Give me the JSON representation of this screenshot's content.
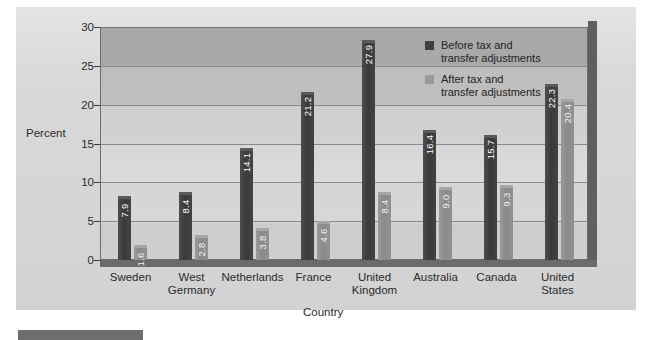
{
  "chart_data": {
    "type": "bar",
    "title": "",
    "xlabel": "Country",
    "ylabel": "Percent",
    "ylim": [
      0,
      30
    ],
    "yticks": [
      "0",
      "5",
      "10",
      "15",
      "20",
      "25",
      "30"
    ],
    "grid": true,
    "legend_position": "inside-top-right",
    "categories": [
      "Sweden",
      "West\nGermany",
      "Netherlands",
      "France",
      "United\nKingdom",
      "Australia",
      "Canada",
      "United\nStates"
    ],
    "series": [
      {
        "name": "Before tax and\ntransfer adjustments",
        "color": "#3f3f3f",
        "values": [
          7.9,
          8.4,
          14.1,
          21.2,
          27.9,
          16.4,
          15.7,
          22.3
        ],
        "labels": [
          "7.9",
          "8.4",
          "14.1",
          "21.2",
          "27.9",
          "16.4",
          "15.7",
          "22.3"
        ]
      },
      {
        "name": "After tax and\ntransfer adjustments",
        "color": "#9a9a9a",
        "values": [
          1.6,
          2.8,
          3.8,
          4.6,
          8.4,
          9.0,
          9.3,
          20.4
        ],
        "labels": [
          "1.6",
          "2.8",
          "3.8",
          "4.6",
          "8.4",
          "9.0",
          "9.3",
          "20.4"
        ]
      }
    ]
  },
  "legend": {
    "items": [
      {
        "label": "Before tax and\ntransfer adjustments",
        "color": "#3f3f3f"
      },
      {
        "label": "After tax and\ntransfer adjustments",
        "color": "#9a9a9a"
      }
    ]
  },
  "axes": {
    "y_title": "Percent",
    "x_title": "Country"
  }
}
